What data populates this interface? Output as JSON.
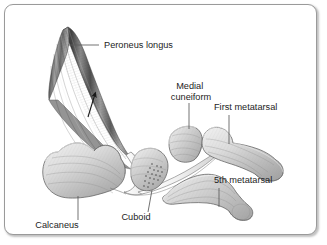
{
  "figure": {
    "frame": {
      "border_color": "#9a9a9a",
      "background_color": "#ffffff",
      "corner_radius": 9
    },
    "palette": {
      "bone_fill_light": "#e8e8e8",
      "bone_fill_mid": "#c9c9c9",
      "bone_fill_dark": "#a8a8a8",
      "bone_outline": "#5f5f5f",
      "muscle_dark": "#4a4a4a",
      "muscle_mid": "#8c8c8c",
      "muscle_light": "#d0d0d0",
      "tendon_fill": "#f4f4f4",
      "tendon_outline": "#6b6b6b",
      "leader_line": "#5a5a5a",
      "arrow_color": "#1a1a1a",
      "text_color": "#1d1d1d",
      "stipple_color": "#4a4a4a"
    },
    "labels": [
      {
        "id": "peroneus-longus",
        "text": "Peroneus longus",
        "lines": [
          "Peroneus longus"
        ],
        "text_x": 104,
        "text_y": 48,
        "anchor": "start",
        "leader": {
          "x1": 99,
          "y1": 45,
          "x2": 68,
          "y2": 45
        }
      },
      {
        "id": "medial-cuneiform",
        "text": "Medial cuneiform",
        "lines": [
          "Medial",
          "cuneiform"
        ],
        "text_x": 191,
        "text_y": 89,
        "line_height": 11,
        "anchor": "middle",
        "leader": {
          "x1": 189,
          "y1": 103,
          "x2": 189,
          "y2": 128
        }
      },
      {
        "id": "first-metatarsal",
        "text": "First metatarsal",
        "lines": [
          "First metatarsal"
        ],
        "text_x": 214,
        "text_y": 110,
        "anchor": "start",
        "leader": {
          "x1": 229,
          "y1": 115,
          "x2": 229,
          "y2": 143
        }
      },
      {
        "id": "fifth-metatarsal",
        "text": "5th metatarsal",
        "lines": [
          "5th metatarsal"
        ],
        "text_x": 214,
        "text_y": 183,
        "anchor": "start",
        "leader": {
          "x1": 219,
          "y1": 188,
          "x2": 219,
          "y2": 206
        }
      },
      {
        "id": "cuboid",
        "text": "Cuboid",
        "lines": [
          "Cuboid"
        ],
        "text_x": 136,
        "text_y": 220,
        "anchor": "middle",
        "leader": {
          "x1": 148,
          "y1": 212,
          "x2": 152,
          "y2": 190
        }
      },
      {
        "id": "calcaneus",
        "text": "Calcaneus",
        "lines": [
          "Calcaneus"
        ],
        "text_x": 57,
        "text_y": 228,
        "anchor": "middle",
        "leader": {
          "x1": 78,
          "y1": 220,
          "x2": 78,
          "y2": 196
        }
      }
    ],
    "structures": [
      {
        "id": "peroneus-longus-muscle",
        "name": "Peroneus longus muscle belly"
      },
      {
        "id": "peroneus-longus-tendon",
        "name": "Peroneus longus tendon"
      },
      {
        "id": "calcaneus-bone",
        "name": "Calcaneus"
      },
      {
        "id": "cuboid-bone",
        "name": "Cuboid"
      },
      {
        "id": "medial-cuneiform-bone",
        "name": "Medial cuneiform"
      },
      {
        "id": "first-metatarsal-bone",
        "name": "First metatarsal"
      },
      {
        "id": "fifth-metatarsal-bone",
        "name": "5th metatarsal"
      },
      {
        "id": "direction-arrow",
        "name": "Direction of muscle pull arrow"
      }
    ],
    "arrow": {
      "id": "direction-arrow",
      "description": "Upward arrow indicating direction of peroneus longus pull",
      "x1": 88,
      "y1": 117,
      "x2": 95,
      "y2": 92
    }
  }
}
